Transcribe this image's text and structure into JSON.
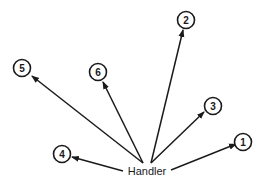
{
  "diagram": {
    "center": {
      "label": "Handler",
      "x": 147,
      "y": 171
    },
    "nodes": [
      {
        "id": "1",
        "label": "1",
        "cx": 243,
        "cy": 142,
        "ax": 236,
        "ay": 144
      },
      {
        "id": "2",
        "label": "2",
        "cx": 186,
        "cy": 20,
        "ax": 183,
        "ay": 30
      },
      {
        "id": "3",
        "label": "3",
        "cx": 213,
        "cy": 106,
        "ax": 204,
        "ay": 112
      },
      {
        "id": "4",
        "label": "4",
        "cx": 62,
        "cy": 154,
        "ax": 72,
        "ay": 157
      },
      {
        "id": "5",
        "label": "5",
        "cx": 22,
        "cy": 68,
        "ax": 32,
        "ay": 76
      },
      {
        "id": "6",
        "label": "6",
        "cx": 98,
        "cy": 72,
        "ax": 103,
        "ay": 82
      }
    ],
    "stroke_color": "#1a1a1a"
  }
}
